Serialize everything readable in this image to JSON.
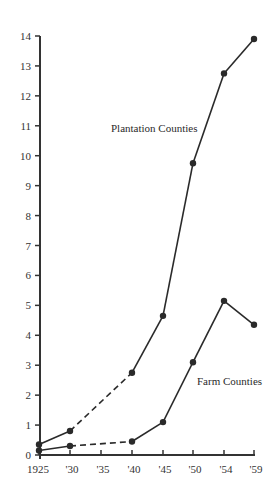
{
  "chart_data": {
    "type": "line",
    "title": "",
    "xlabel": "",
    "ylabel": "",
    "x": [
      "1925",
      "'30",
      "'35",
      "'40",
      "'45",
      "'50",
      "'54",
      "'59"
    ],
    "x_values": [
      1925,
      1930,
      1935,
      1940,
      1945,
      1950,
      1954,
      1959
    ],
    "ylim": [
      0,
      14
    ],
    "y_ticks": [
      "0",
      "1",
      "2",
      "3",
      "4",
      "5",
      "6",
      "7",
      "8",
      "9",
      "10",
      "11",
      "12",
      "13",
      "14"
    ],
    "grid": false,
    "legend": "inline labels",
    "series": [
      {
        "name": "Plantation Counties",
        "points": [
          {
            "x": 1925,
            "y": 0.35
          },
          {
            "x": 1930,
            "y": 0.8
          },
          {
            "x": 1940,
            "y": 2.75
          },
          {
            "x": 1945,
            "y": 4.65
          },
          {
            "x": 1950,
            "y": 9.75
          },
          {
            "x": 1954,
            "y": 12.75
          },
          {
            "x": 1959,
            "y": 13.9
          }
        ],
        "dashed_segments": [
          [
            1930,
            1940
          ]
        ],
        "label_position": {
          "x": 111,
          "y": 132
        }
      },
      {
        "name": "Farm Counties",
        "points": [
          {
            "x": 1925,
            "y": 0.15
          },
          {
            "x": 1930,
            "y": 0.3
          },
          {
            "x": 1940,
            "y": 0.45
          },
          {
            "x": 1945,
            "y": 1.1
          },
          {
            "x": 1950,
            "y": 3.1
          },
          {
            "x": 1954,
            "y": 5.15
          },
          {
            "x": 1959,
            "y": 4.35
          }
        ],
        "dashed_segments": [
          [
            1930,
            1940
          ]
        ],
        "label_position": {
          "x": 197,
          "y": 385
        }
      }
    ],
    "colors": {
      "line": "#2a2a2a",
      "axis": "#333333",
      "background": "#ffffff"
    }
  }
}
